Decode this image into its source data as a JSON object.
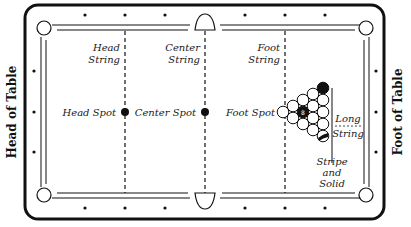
{
  "diagram": {
    "side_labels": {
      "left": "Head of Table",
      "right": "Foot of Table"
    },
    "strings": {
      "head": {
        "line1": "Head",
        "line2": "String"
      },
      "center": {
        "line1": "Center",
        "line2": "String"
      },
      "foot": {
        "line1": "Foot",
        "line2": "String"
      },
      "long": {
        "line1": "Long",
        "line2": "String"
      }
    },
    "spots": {
      "head": "Head Spot",
      "center": "Center Spot",
      "foot": "Foot Spot"
    },
    "rack_note": {
      "line1": "Stripe",
      "line2": "and",
      "line3": "Solid"
    },
    "eight_ball_label": "8",
    "colors": {
      "ink": "#111111",
      "background": "#ffffff"
    }
  }
}
